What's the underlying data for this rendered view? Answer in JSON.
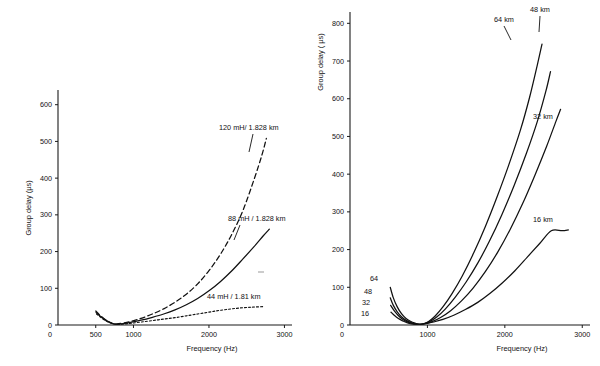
{
  "figure": {
    "background": "#ffffff",
    "ink_color": "#111111"
  },
  "chart_data": [
    {
      "id": "left",
      "type": "line",
      "title": "",
      "xlabel": "Frequency (Hz)",
      "ylabel": "Group delay (µs)",
      "xlim": [
        0,
        3100
      ],
      "ylim": [
        0,
        640
      ],
      "xticks": [
        0,
        500,
        1000,
        2000,
        3000
      ],
      "xticklabels": [
        "0",
        "500",
        "1000",
        "2000",
        "3000"
      ],
      "yticks": [
        0,
        100,
        200,
        300,
        400,
        500,
        600
      ],
      "yticklabels": [
        "0",
        "100",
        "200",
        "300",
        "400",
        "500",
        "600"
      ],
      "grid": false,
      "legend": "inline-annotations",
      "series": [
        {
          "name": "120 mH/ 1.828 km",
          "label": "120 mH/ 1.828 km",
          "style": "dashed",
          "x": [
            500,
            560,
            620,
            680,
            730,
            780,
            850,
            950,
            1100,
            1250,
            1400,
            1550,
            1700,
            1850,
            2000,
            2150,
            2300,
            2450,
            2600,
            2700,
            2760
          ],
          "y": [
            38,
            26,
            16,
            8,
            4,
            3,
            5,
            9,
            18,
            30,
            44,
            62,
            84,
            112,
            148,
            192,
            246,
            312,
            398,
            462,
            508
          ]
        },
        {
          "name": "88 mH / 1.828 km",
          "label": "88 mH / 1.828 km",
          "style": "solid",
          "x": [
            505,
            565,
            625,
            685,
            735,
            790,
            860,
            960,
            1100,
            1250,
            1400,
            1550,
            1700,
            1850,
            2000,
            2150,
            2300,
            2450,
            2600,
            2720,
            2800
          ],
          "y": [
            34,
            23,
            14,
            7,
            3,
            2,
            4,
            7,
            13,
            21,
            30,
            41,
            55,
            72,
            93,
            118,
            147,
            180,
            214,
            243,
            261
          ]
        },
        {
          "name": "44 mH / 1.81 km",
          "label": "44 mH / 1.81 km",
          "style": "dotted",
          "x": [
            510,
            570,
            630,
            690,
            740,
            800,
            880,
            980,
            1100,
            1250,
            1400,
            1550,
            1700,
            1850,
            2000,
            2150,
            2300,
            2450,
            2600,
            2720
          ],
          "y": [
            30,
            20,
            12,
            6,
            3,
            2,
            3,
            5,
            8,
            12,
            16,
            20,
            25,
            30,
            35,
            40,
            44,
            47,
            49,
            50
          ]
        }
      ]
    },
    {
      "id": "right",
      "type": "line",
      "title": "",
      "xlabel": "Frequency (Hz)",
      "ylabel": "Group delay ( µs)",
      "xlim": [
        0,
        3100
      ],
      "ylim": [
        0,
        830
      ],
      "xticks": [
        0,
        1000,
        2000,
        3000
      ],
      "xticklabels": [
        "0",
        "1000",
        "2000",
        "3000"
      ],
      "yticks": [
        0,
        100,
        200,
        300,
        400,
        500,
        600,
        700,
        800
      ],
      "yticklabels": [
        "0",
        "100",
        "200",
        "300",
        "400",
        "500",
        "600",
        "700",
        "800"
      ],
      "grid": false,
      "legend": "inline-annotations",
      "series": [
        {
          "name": "64 km",
          "label_right": "64 km",
          "label_left": "64",
          "style": "solid",
          "x": [
            520,
            560,
            610,
            665,
            720,
            780,
            840,
            900,
            960,
            1020,
            1100,
            1200,
            1320,
            1450,
            1600,
            1750,
            1900,
            2050,
            2200,
            2320,
            2420,
            2480
          ],
          "y": [
            100,
            72,
            48,
            30,
            18,
            10,
            5,
            2,
            4,
            10,
            24,
            48,
            84,
            130,
            192,
            262,
            340,
            424,
            516,
            604,
            690,
            745
          ]
        },
        {
          "name": "48 km",
          "label_right": "48 km",
          "label_left": "48",
          "style": "solid",
          "x": [
            520,
            560,
            610,
            665,
            720,
            780,
            845,
            905,
            965,
            1030,
            1120,
            1230,
            1360,
            1500,
            1650,
            1800,
            1960,
            2120,
            2280,
            2420,
            2530,
            2590
          ],
          "y": [
            72,
            52,
            35,
            22,
            13,
            7,
            3,
            2,
            4,
            9,
            21,
            42,
            74,
            114,
            164,
            222,
            292,
            370,
            456,
            540,
            620,
            672
          ]
        },
        {
          "name": "32 km",
          "label_right": "32 km",
          "label_left": "32",
          "style": "solid",
          "x": [
            525,
            570,
            620,
            675,
            730,
            790,
            855,
            915,
            980,
            1060,
            1170,
            1300,
            1440,
            1590,
            1750,
            1910,
            2070,
            2230,
            2390,
            2540,
            2660,
            2720
          ],
          "y": [
            52,
            38,
            26,
            16,
            9,
            5,
            2,
            2,
            4,
            9,
            20,
            38,
            64,
            98,
            142,
            194,
            254,
            322,
            398,
            474,
            540,
            572
          ]
        },
        {
          "name": "16 km",
          "label_right": "16 km",
          "label_left": "16",
          "style": "solid",
          "x": [
            530,
            575,
            625,
            680,
            735,
            795,
            860,
            925,
            995,
            1080,
            1200,
            1340,
            1490,
            1650,
            1810,
            1970,
            2130,
            2290,
            2450,
            2600,
            2740,
            2820
          ],
          "y": [
            34,
            25,
            17,
            11,
            6,
            3,
            2,
            2,
            4,
            8,
            15,
            26,
            41,
            60,
            84,
            112,
            144,
            180,
            216,
            250,
            250,
            252
          ]
        }
      ]
    }
  ]
}
